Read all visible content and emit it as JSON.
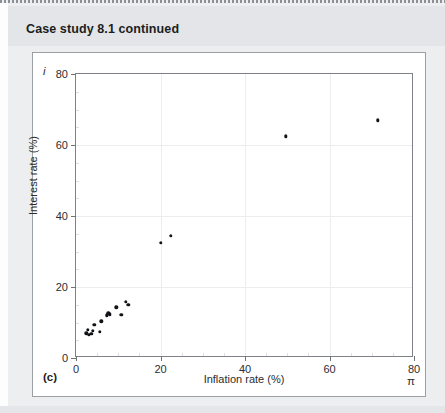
{
  "header": {
    "title": "Case study 8.1 continued"
  },
  "figure": {
    "panel_label": "(c)",
    "y_axis_symbol": "i",
    "x_axis_symbol": "π"
  },
  "chart_data": {
    "type": "scatter",
    "title": "",
    "xlabel": "Inflation rate (%)",
    "ylabel": "Interest rate (%)",
    "xlim": [
      0,
      80
    ],
    "ylim": [
      0,
      80
    ],
    "xticks": [
      0,
      20,
      40,
      60,
      80
    ],
    "yticks": [
      0,
      20,
      40,
      60,
      80
    ],
    "xticklabels": [
      "0",
      "20",
      "40",
      "60",
      "80"
    ],
    "yticklabels": [
      "0",
      "20",
      "40",
      "60",
      "80"
    ],
    "grid": true,
    "legend": false,
    "marker_color": "#111316",
    "points": [
      {
        "x": 2.4,
        "y": 7.0
      },
      {
        "x": 2.8,
        "y": 8.0
      },
      {
        "x": 3.1,
        "y": 6.6
      },
      {
        "x": 3.6,
        "y": 6.9
      },
      {
        "x": 4.0,
        "y": 7.6
      },
      {
        "x": 4.3,
        "y": 9.3
      },
      {
        "x": 5.7,
        "y": 7.3
      },
      {
        "x": 6.0,
        "y": 10.3
      },
      {
        "x": 7.3,
        "y": 12.0
      },
      {
        "x": 7.6,
        "y": 12.6
      },
      {
        "x": 8.0,
        "y": 12.3
      },
      {
        "x": 9.5,
        "y": 14.3
      },
      {
        "x": 10.7,
        "y": 12.1
      },
      {
        "x": 11.8,
        "y": 15.8
      },
      {
        "x": 12.4,
        "y": 15.0
      },
      {
        "x": 20.0,
        "y": 32.5
      },
      {
        "x": 22.4,
        "y": 34.4
      },
      {
        "x": 49.7,
        "y": 62.5
      },
      {
        "x": 71.5,
        "y": 67.0
      }
    ]
  }
}
